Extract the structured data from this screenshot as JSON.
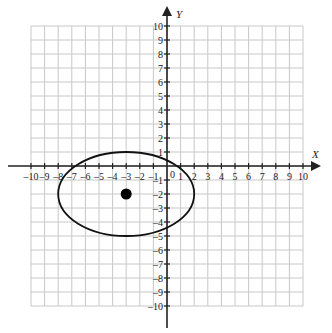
{
  "chart_data": {
    "type": "scatter",
    "title": "",
    "xlabel": "X",
    "ylabel": "Y",
    "xlim": [
      -10,
      10
    ],
    "ylim": [
      -10,
      10
    ],
    "grid": true,
    "x_ticks": [
      -10,
      -9,
      -8,
      -7,
      -6,
      -5,
      -4,
      -3,
      -2,
      -1,
      1,
      2,
      3,
      4,
      5,
      6,
      7,
      8,
      9,
      10
    ],
    "y_ticks": [
      -10,
      -9,
      -8,
      -7,
      -6,
      -5,
      -4,
      -3,
      -2,
      -1,
      1,
      2,
      3,
      4,
      5,
      6,
      7,
      8,
      9,
      10
    ],
    "origin_label": "0",
    "shapes": [
      {
        "kind": "ellipse",
        "center": [
          -3,
          -2
        ],
        "rx": 5,
        "ry": 3,
        "fill": "none",
        "stroke": "#111111"
      }
    ],
    "points": [
      {
        "x": -3,
        "y": -2,
        "label": "center",
        "color": "#000000"
      }
    ]
  },
  "colors": {
    "grid": "#c8c8c8",
    "axis": "#222222",
    "ellipse": "#111111",
    "point": "#000000"
  }
}
